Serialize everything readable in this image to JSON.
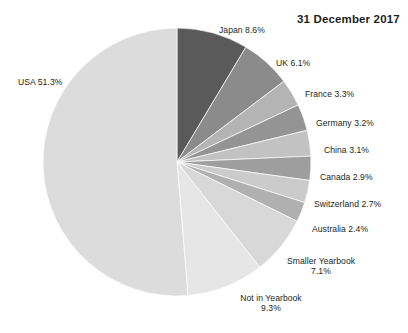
{
  "title": "31 December 2017",
  "chart_data": {
    "type": "pie",
    "title": "31 December 2017",
    "legend_position": "outside-labels",
    "grid": false,
    "start_angle_deg": 0,
    "direction": "clockwise",
    "center": {
      "x": 177,
      "y": 162
    },
    "radius": 134,
    "categories": [
      "Japan",
      "UK",
      "France",
      "Germany",
      "China",
      "Canada",
      "Switzerland",
      "Australia",
      "Smaller Yearbook",
      "Not in Yearbook",
      "USA"
    ],
    "values": [
      8.6,
      6.1,
      3.3,
      3.2,
      3.1,
      2.9,
      2.7,
      2.4,
      7.1,
      9.3,
      51.3
    ],
    "unit": "%",
    "slices": [
      {
        "name": "Japan",
        "value": 8.6,
        "label": "Japan 8.6%",
        "color": "#5a5a5a"
      },
      {
        "name": "UK",
        "value": 6.1,
        "label": "UK 6.1%",
        "color": "#8b8b8b"
      },
      {
        "name": "France",
        "value": 3.3,
        "label": "France 3.3%",
        "color": "#b4b4b4"
      },
      {
        "name": "Germany",
        "value": 3.2,
        "label": "Germany 3.2%",
        "color": "#949494"
      },
      {
        "name": "China",
        "value": 3.1,
        "label": "China 3.1%",
        "color": "#c2c2c2"
      },
      {
        "name": "Canada",
        "value": 2.9,
        "label": "Canada 2.9%",
        "color": "#9e9e9e"
      },
      {
        "name": "Switzerland",
        "value": 2.7,
        "label": "Switzerland 2.7%",
        "color": "#cbcbcb"
      },
      {
        "name": "Australia",
        "value": 2.4,
        "label": "Australia 2.4%",
        "color": "#b0b0b0"
      },
      {
        "name": "Smaller Yearbook",
        "value": 7.1,
        "label": "Smaller Yearbook",
        "label2": "7.1%",
        "color": "#d8d8d8"
      },
      {
        "name": "Not in Yearbook",
        "value": 9.3,
        "label": "Not in Yearbook",
        "label2": "9.3%",
        "color": "#e6e6e6"
      },
      {
        "name": "USA",
        "value": 51.3,
        "label": "USA 51.3%",
        "color": "#dcdcdc"
      }
    ]
  },
  "labels": {
    "japan": "Japan 8.6%",
    "uk": "UK 6.1%",
    "france": "France 3.3%",
    "germany": "Germany 3.2%",
    "china": "China 3.1%",
    "canada": "Canada 2.9%",
    "switzerland": "Switzerland 2.7%",
    "australia": "Australia 2.4%",
    "smaller_yearbook_line1": "Smaller Yearbook",
    "smaller_yearbook_line2": "7.1%",
    "not_in_yearbook_line1": "Not in Yearbook",
    "not_in_yearbook_line2": "9.3%",
    "usa": "USA 51.3%"
  }
}
